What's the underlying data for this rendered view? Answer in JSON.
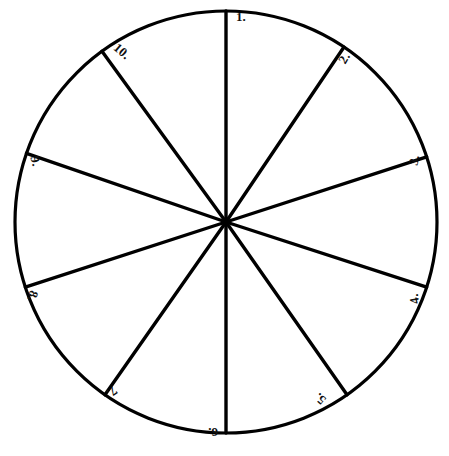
{
  "figure": {
    "background_color": "#ffffff",
    "stroke_color": "#000000",
    "fill_color": "#ffffff",
    "circle": {
      "center_x": 226,
      "center_y": 222,
      "radius": 211,
      "stroke_width": 3.2
    },
    "footer_text": ""
  },
  "chart_data": {
    "type": "pie",
    "title": "",
    "xlabel": "",
    "ylabel": "",
    "legend": "none",
    "grid": false,
    "labels_shown_inside_sectors": false,
    "note": "Blank (unfilled) pie chart template with 10 numbered sectors; sector boundary spokes drawn from center to circumference.",
    "categories": [
      "1.",
      "2.",
      "3.",
      "4.",
      "5.",
      "6.",
      "7.",
      "8.",
      "9.",
      "10."
    ],
    "values": [
      34,
      38,
      36,
      37,
      35,
      35,
      37,
      37,
      38,
      35
    ],
    "units": "degrees",
    "boundary_angles_deg_from_north_clockwise": [
      0,
      34,
      72,
      108,
      145,
      180,
      215,
      252,
      289,
      324
    ]
  },
  "spokes": [
    {
      "name": "spoke-1",
      "angle": 0
    },
    {
      "name": "spoke-2",
      "angle": 34
    },
    {
      "name": "spoke-3",
      "angle": 72
    },
    {
      "name": "spoke-4",
      "angle": 108
    },
    {
      "name": "spoke-5",
      "angle": 145
    },
    {
      "name": "spoke-6",
      "angle": 180
    },
    {
      "name": "spoke-7",
      "angle": 215
    },
    {
      "name": "spoke-8",
      "angle": 252
    },
    {
      "name": "spoke-9",
      "angle": 289
    },
    {
      "name": "spoke-10",
      "angle": 324
    }
  ],
  "labels": [
    {
      "id": "label-1",
      "text": "1.",
      "x": 241,
      "y": 16,
      "rotation": 0
    },
    {
      "id": "label-2",
      "text": "2.",
      "x": 344,
      "y": 58,
      "rotation": -60
    },
    {
      "id": "label-3",
      "text": "3.",
      "x": 414,
      "y": 160,
      "rotation": -78
    },
    {
      "id": "label-4",
      "text": "4.",
      "x": 414,
      "y": 299,
      "rotation": -100
    },
    {
      "id": "label-5",
      "text": "5.",
      "x": 320,
      "y": 399,
      "rotation": -140
    },
    {
      "id": "label-6",
      "text": "6.",
      "x": 213,
      "y": 432,
      "rotation": 180
    },
    {
      "id": "label-7",
      "text": "7.",
      "x": 112,
      "y": 392,
      "rotation": 145
    },
    {
      "id": "label-8",
      "text": "8.",
      "x": 33,
      "y": 296,
      "rotation": 108
    },
    {
      "id": "label-9",
      "text": "9.",
      "x": 36,
      "y": 161,
      "rotation": 75
    },
    {
      "id": "label-10",
      "text": "10.",
      "x": 122,
      "y": 51,
      "rotation": 40
    }
  ]
}
